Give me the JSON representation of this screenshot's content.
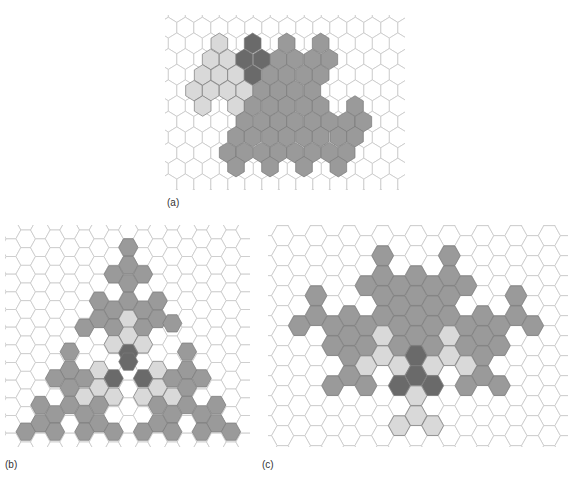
{
  "colors": {
    "grid_line": "#c8c8c8",
    "empty": "#ffffff",
    "light": "#d9d9d9",
    "medium": "#9a9a9a",
    "dark": "#6a6a6a",
    "filled_stroke": "#7a7a7a"
  },
  "panels": [
    {
      "id": "a",
      "label": "(a)",
      "orientation": "pointy",
      "box": {
        "x": 165,
        "y": 15,
        "w": 240,
        "h": 175
      },
      "label_pos": {
        "x": 167,
        "y": 197
      },
      "origin": {
        "x": 160,
        "y": 0
      },
      "scale": 3,
      "col_step": 51,
      "row_step": 47,
      "first_row_y": 83,
      "rows": 11,
      "cols": 15,
      "first_col_x": 25,
      "cells": [
        {
          "x": 178,
          "y": 130,
          "t": "light"
        },
        {
          "x": 278,
          "y": 130,
          "t": "dark"
        },
        {
          "x": 380,
          "y": 130,
          "t": "medium"
        },
        {
          "x": 482,
          "y": 130,
          "t": "medium"
        },
        {
          "x": 152,
          "y": 178,
          "t": "light"
        },
        {
          "x": 203,
          "y": 178,
          "t": "light"
        },
        {
          "x": 253,
          "y": 178,
          "t": "dark"
        },
        {
          "x": 305,
          "y": 178,
          "t": "dark"
        },
        {
          "x": 355,
          "y": 178,
          "t": "medium"
        },
        {
          "x": 405,
          "y": 178,
          "t": "medium"
        },
        {
          "x": 457,
          "y": 178,
          "t": "medium"
        },
        {
          "x": 508,
          "y": 178,
          "t": "medium"
        },
        {
          "x": 128,
          "y": 225,
          "t": "light"
        },
        {
          "x": 178,
          "y": 225,
          "t": "light"
        },
        {
          "x": 228,
          "y": 225,
          "t": "light"
        },
        {
          "x": 278,
          "y": 225,
          "t": "dark"
        },
        {
          "x": 330,
          "y": 225,
          "t": "medium"
        },
        {
          "x": 380,
          "y": 225,
          "t": "medium"
        },
        {
          "x": 432,
          "y": 225,
          "t": "medium"
        },
        {
          "x": 482,
          "y": 225,
          "t": "medium"
        },
        {
          "x": 102,
          "y": 272,
          "t": "light"
        },
        {
          "x": 152,
          "y": 272,
          "t": "light"
        },
        {
          "x": 203,
          "y": 272,
          "t": "light"
        },
        {
          "x": 253,
          "y": 272,
          "t": "light"
        },
        {
          "x": 305,
          "y": 272,
          "t": "medium"
        },
        {
          "x": 355,
          "y": 272,
          "t": "medium"
        },
        {
          "x": 405,
          "y": 272,
          "t": "medium"
        },
        {
          "x": 457,
          "y": 272,
          "t": "medium"
        },
        {
          "x": 128,
          "y": 318,
          "t": "light"
        },
        {
          "x": 228,
          "y": 318,
          "t": "light"
        },
        {
          "x": 278,
          "y": 318,
          "t": "medium"
        },
        {
          "x": 330,
          "y": 318,
          "t": "medium"
        },
        {
          "x": 380,
          "y": 318,
          "t": "medium"
        },
        {
          "x": 432,
          "y": 318,
          "t": "medium"
        },
        {
          "x": 482,
          "y": 318,
          "t": "medium"
        },
        {
          "x": 585,
          "y": 318,
          "t": "medium"
        },
        {
          "x": 253,
          "y": 365,
          "t": "medium"
        },
        {
          "x": 305,
          "y": 365,
          "t": "medium"
        },
        {
          "x": 355,
          "y": 365,
          "t": "medium"
        },
        {
          "x": 405,
          "y": 365,
          "t": "medium"
        },
        {
          "x": 457,
          "y": 365,
          "t": "medium"
        },
        {
          "x": 508,
          "y": 365,
          "t": "medium"
        },
        {
          "x": 560,
          "y": 365,
          "t": "medium"
        },
        {
          "x": 610,
          "y": 365,
          "t": "medium"
        },
        {
          "x": 228,
          "y": 410,
          "t": "medium"
        },
        {
          "x": 278,
          "y": 410,
          "t": "medium"
        },
        {
          "x": 330,
          "y": 410,
          "t": "medium"
        },
        {
          "x": 380,
          "y": 410,
          "t": "medium"
        },
        {
          "x": 432,
          "y": 410,
          "t": "medium"
        },
        {
          "x": 482,
          "y": 410,
          "t": "medium"
        },
        {
          "x": 535,
          "y": 410,
          "t": "medium"
        },
        {
          "x": 585,
          "y": 410,
          "t": "medium"
        },
        {
          "x": 203,
          "y": 458,
          "t": "medium"
        },
        {
          "x": 253,
          "y": 458,
          "t": "medium"
        },
        {
          "x": 305,
          "y": 458,
          "t": "medium"
        },
        {
          "x": 355,
          "y": 458,
          "t": "medium"
        },
        {
          "x": 405,
          "y": 458,
          "t": "medium"
        },
        {
          "x": 457,
          "y": 458,
          "t": "medium"
        },
        {
          "x": 508,
          "y": 458,
          "t": "medium"
        },
        {
          "x": 560,
          "y": 458,
          "t": "medium"
        },
        {
          "x": 228,
          "y": 500,
          "t": "medium"
        },
        {
          "x": 330,
          "y": 500,
          "t": "medium"
        },
        {
          "x": 432,
          "y": 500,
          "t": "medium"
        },
        {
          "x": 535,
          "y": 500,
          "t": "medium"
        }
      ]
    },
    {
      "id": "b",
      "label": "(b)",
      "orientation": "flat",
      "box": {
        "x": 5,
        "y": 225,
        "w": 245,
        "h": 222
      },
      "label_pos": {
        "x": 5,
        "y": 459
      },
      "origin": {
        "x": 0,
        "y": 215
      },
      "scale": 3,
      "col_step": 44,
      "row_step": 53,
      "first_row_y": 45,
      "rows": 13,
      "cols": 17,
      "first_col_x": 33,
      "cells": [
        {
          "x": 385,
          "y": 97,
          "t": "medium"
        },
        {
          "x": 385,
          "y": 150,
          "t": "medium"
        },
        {
          "x": 341,
          "y": 178,
          "t": "medium"
        },
        {
          "x": 429,
          "y": 178,
          "t": "medium"
        },
        {
          "x": 385,
          "y": 205,
          "t": "medium"
        },
        {
          "x": 297,
          "y": 258,
          "t": "medium"
        },
        {
          "x": 385,
          "y": 258,
          "t": "medium"
        },
        {
          "x": 473,
          "y": 258,
          "t": "medium"
        },
        {
          "x": 341,
          "y": 285,
          "t": "medium"
        },
        {
          "x": 429,
          "y": 285,
          "t": "medium"
        },
        {
          "x": 297,
          "y": 312,
          "t": "medium"
        },
        {
          "x": 385,
          "y": 312,
          "t": "light"
        },
        {
          "x": 473,
          "y": 312,
          "t": "medium"
        },
        {
          "x": 253,
          "y": 338,
          "t": "medium"
        },
        {
          "x": 341,
          "y": 338,
          "t": "medium"
        },
        {
          "x": 429,
          "y": 338,
          "t": "medium"
        },
        {
          "x": 517,
          "y": 325,
          "t": "medium"
        },
        {
          "x": 385,
          "y": 362,
          "t": "light"
        },
        {
          "x": 341,
          "y": 388,
          "t": "light"
        },
        {
          "x": 429,
          "y": 388,
          "t": "light"
        },
        {
          "x": 209,
          "y": 410,
          "t": "medium"
        },
        {
          "x": 385,
          "y": 415,
          "t": "dark"
        },
        {
          "x": 561,
          "y": 410,
          "t": "medium"
        },
        {
          "x": 385,
          "y": 440,
          "t": "dark"
        },
        {
          "x": 209,
          "y": 465,
          "t": "medium"
        },
        {
          "x": 297,
          "y": 465,
          "t": "light"
        },
        {
          "x": 473,
          "y": 465,
          "t": "light"
        },
        {
          "x": 561,
          "y": 465,
          "t": "medium"
        },
        {
          "x": 165,
          "y": 490,
          "t": "medium"
        },
        {
          "x": 253,
          "y": 490,
          "t": "medium"
        },
        {
          "x": 341,
          "y": 490,
          "t": "dark"
        },
        {
          "x": 429,
          "y": 490,
          "t": "dark"
        },
        {
          "x": 517,
          "y": 490,
          "t": "medium"
        },
        {
          "x": 605,
          "y": 490,
          "t": "medium"
        },
        {
          "x": 209,
          "y": 518,
          "t": "medium"
        },
        {
          "x": 297,
          "y": 518,
          "t": "light"
        },
        {
          "x": 473,
          "y": 518,
          "t": "light"
        },
        {
          "x": 561,
          "y": 518,
          "t": "medium"
        },
        {
          "x": 253,
          "y": 545,
          "t": "light"
        },
        {
          "x": 341,
          "y": 545,
          "t": "light"
        },
        {
          "x": 429,
          "y": 545,
          "t": "light"
        },
        {
          "x": 517,
          "y": 545,
          "t": "light"
        },
        {
          "x": 121,
          "y": 570,
          "t": "medium"
        },
        {
          "x": 209,
          "y": 570,
          "t": "medium"
        },
        {
          "x": 297,
          "y": 570,
          "t": "medium"
        },
        {
          "x": 473,
          "y": 570,
          "t": "medium"
        },
        {
          "x": 561,
          "y": 570,
          "t": "medium"
        },
        {
          "x": 649,
          "y": 570,
          "t": "medium"
        },
        {
          "x": 165,
          "y": 598,
          "t": "medium"
        },
        {
          "x": 253,
          "y": 598,
          "t": "medium"
        },
        {
          "x": 517,
          "y": 598,
          "t": "medium"
        },
        {
          "x": 605,
          "y": 598,
          "t": "medium"
        },
        {
          "x": 121,
          "y": 625,
          "t": "medium"
        },
        {
          "x": 297,
          "y": 625,
          "t": "medium"
        },
        {
          "x": 473,
          "y": 625,
          "t": "medium"
        },
        {
          "x": 649,
          "y": 625,
          "t": "medium"
        },
        {
          "x": 77,
          "y": 650,
          "t": "medium"
        },
        {
          "x": 165,
          "y": 650,
          "t": "medium"
        },
        {
          "x": 253,
          "y": 650,
          "t": "medium"
        },
        {
          "x": 341,
          "y": 650,
          "t": "medium"
        },
        {
          "x": 429,
          "y": 650,
          "t": "medium"
        },
        {
          "x": 517,
          "y": 650,
          "t": "medium"
        },
        {
          "x": 605,
          "y": 650,
          "t": "medium"
        },
        {
          "x": 693,
          "y": 650,
          "t": "medium"
        }
      ]
    },
    {
      "id": "c",
      "label": "(c)",
      "orientation": "flat",
      "box": {
        "x": 268,
        "y": 225,
        "w": 300,
        "h": 222
      },
      "label_pos": {
        "x": 262,
        "y": 459
      },
      "origin": {
        "x": 260,
        "y": 215
      },
      "scale": 3,
      "col_step": 50,
      "row_step": 60,
      "first_row_y": 32,
      "rows": 12,
      "cols": 18,
      "first_col_x": 18,
      "cells": [
        {
          "x": 368,
          "y": 122,
          "t": "medium"
        },
        {
          "x": 568,
          "y": 122,
          "t": "medium"
        },
        {
          "x": 368,
          "y": 182,
          "t": "medium"
        },
        {
          "x": 468,
          "y": 182,
          "t": "medium"
        },
        {
          "x": 568,
          "y": 182,
          "t": "medium"
        },
        {
          "x": 318,
          "y": 212,
          "t": "medium"
        },
        {
          "x": 418,
          "y": 212,
          "t": "medium"
        },
        {
          "x": 518,
          "y": 212,
          "t": "medium"
        },
        {
          "x": 618,
          "y": 212,
          "t": "medium"
        },
        {
          "x": 168,
          "y": 242,
          "t": "medium"
        },
        {
          "x": 368,
          "y": 242,
          "t": "medium"
        },
        {
          "x": 468,
          "y": 242,
          "t": "medium"
        },
        {
          "x": 568,
          "y": 242,
          "t": "medium"
        },
        {
          "x": 768,
          "y": 242,
          "t": "medium"
        },
        {
          "x": 418,
          "y": 272,
          "t": "medium"
        },
        {
          "x": 518,
          "y": 272,
          "t": "medium"
        },
        {
          "x": 168,
          "y": 302,
          "t": "medium"
        },
        {
          "x": 268,
          "y": 302,
          "t": "medium"
        },
        {
          "x": 368,
          "y": 302,
          "t": "medium"
        },
        {
          "x": 468,
          "y": 302,
          "t": "medium"
        },
        {
          "x": 568,
          "y": 302,
          "t": "medium"
        },
        {
          "x": 668,
          "y": 302,
          "t": "medium"
        },
        {
          "x": 768,
          "y": 302,
          "t": "medium"
        },
        {
          "x": 118,
          "y": 332,
          "t": "medium"
        },
        {
          "x": 218,
          "y": 332,
          "t": "medium"
        },
        {
          "x": 318,
          "y": 332,
          "t": "medium"
        },
        {
          "x": 418,
          "y": 332,
          "t": "medium"
        },
        {
          "x": 518,
          "y": 332,
          "t": "medium"
        },
        {
          "x": 618,
          "y": 332,
          "t": "medium"
        },
        {
          "x": 718,
          "y": 332,
          "t": "medium"
        },
        {
          "x": 818,
          "y": 332,
          "t": "medium"
        },
        {
          "x": 268,
          "y": 362,
          "t": "medium"
        },
        {
          "x": 368,
          "y": 362,
          "t": "light"
        },
        {
          "x": 468,
          "y": 362,
          "t": "medium"
        },
        {
          "x": 568,
          "y": 362,
          "t": "light"
        },
        {
          "x": 668,
          "y": 362,
          "t": "medium"
        },
        {
          "x": 218,
          "y": 392,
          "t": "medium"
        },
        {
          "x": 318,
          "y": 392,
          "t": "medium"
        },
        {
          "x": 418,
          "y": 392,
          "t": "medium"
        },
        {
          "x": 518,
          "y": 392,
          "t": "medium"
        },
        {
          "x": 618,
          "y": 392,
          "t": "medium"
        },
        {
          "x": 718,
          "y": 392,
          "t": "medium"
        },
        {
          "x": 268,
          "y": 422,
          "t": "medium"
        },
        {
          "x": 368,
          "y": 422,
          "t": "light"
        },
        {
          "x": 468,
          "y": 422,
          "t": "dark"
        },
        {
          "x": 568,
          "y": 422,
          "t": "light"
        },
        {
          "x": 668,
          "y": 422,
          "t": "medium"
        },
        {
          "x": 318,
          "y": 452,
          "t": "light"
        },
        {
          "x": 418,
          "y": 452,
          "t": "light"
        },
        {
          "x": 518,
          "y": 452,
          "t": "light"
        },
        {
          "x": 618,
          "y": 452,
          "t": "light"
        },
        {
          "x": 268,
          "y": 482,
          "t": "medium"
        },
        {
          "x": 468,
          "y": 482,
          "t": "dark"
        },
        {
          "x": 668,
          "y": 482,
          "t": "medium"
        },
        {
          "x": 218,
          "y": 512,
          "t": "medium"
        },
        {
          "x": 318,
          "y": 512,
          "t": "medium"
        },
        {
          "x": 418,
          "y": 512,
          "t": "dark"
        },
        {
          "x": 518,
          "y": 512,
          "t": "dark"
        },
        {
          "x": 618,
          "y": 512,
          "t": "medium"
        },
        {
          "x": 718,
          "y": 512,
          "t": "medium"
        },
        {
          "x": 468,
          "y": 542,
          "t": "light"
        },
        {
          "x": 468,
          "y": 602,
          "t": "light"
        },
        {
          "x": 418,
          "y": 632,
          "t": "light"
        },
        {
          "x": 518,
          "y": 632,
          "t": "light"
        }
      ]
    }
  ]
}
